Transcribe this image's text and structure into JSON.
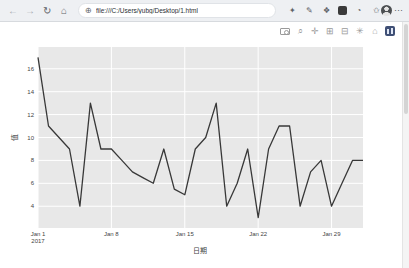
{
  "browser": {
    "nav": {
      "back_icon": "←",
      "forward_icon": "→",
      "refresh_icon": "↻",
      "home_icon": "⌂"
    },
    "address": {
      "site_icon": "⊕",
      "url": "file:///C:/Users/yubg/Desktop/1.html"
    },
    "extensions": [
      {
        "name": "extension-icon-1",
        "glyph": "✦"
      },
      {
        "name": "extension-icon-2",
        "glyph": "✎"
      },
      {
        "name": "extension-icon-3",
        "glyph": "❖"
      },
      {
        "name": "extension-icon-4",
        "glyph": "",
        "dark": true
      },
      {
        "name": "extension-icon-5",
        "glyph": "◔"
      },
      {
        "name": "extension-icon-6",
        "glyph": "✩"
      }
    ],
    "more_icon": "⋯"
  },
  "modebar": {
    "buttons": [
      {
        "name": "download-plot-camera-icon",
        "type": "camera",
        "glyph": ""
      },
      {
        "name": "zoom-icon",
        "glyph": "⌕"
      },
      {
        "name": "pan-icon",
        "glyph": "✛"
      },
      {
        "name": "zoom-in-icon",
        "glyph": "⊞"
      },
      {
        "name": "zoom-out-icon",
        "glyph": "⊟"
      },
      {
        "name": "autoscale-icon",
        "glyph": "✳"
      },
      {
        "name": "reset-axes-icon",
        "glyph": "⌂"
      },
      {
        "name": "plotly-logo-icon",
        "type": "logo",
        "glyph": ""
      }
    ]
  },
  "chart_data": {
    "type": "line",
    "title": "",
    "xlabel": "日期",
    "ylabel": "值",
    "x_year": "2017",
    "x_dates": [
      "Jan 1",
      "Jan 2",
      "Jan 3",
      "Jan 4",
      "Jan 5",
      "Jan 6",
      "Jan 7",
      "Jan 8",
      "Jan 9",
      "Jan 10",
      "Jan 11",
      "Jan 12",
      "Jan 13",
      "Jan 14",
      "Jan 15",
      "Jan 16",
      "Jan 17",
      "Jan 18",
      "Jan 19",
      "Jan 20",
      "Jan 21",
      "Jan 22",
      "Jan 23",
      "Jan 24",
      "Jan 25",
      "Jan 26",
      "Jan 27",
      "Jan 28",
      "Jan 29",
      "Jan 30",
      "Jan 31",
      "Feb 1"
    ],
    "values": [
      17,
      11,
      10,
      9,
      4,
      13,
      9,
      9,
      8,
      7,
      6.5,
      6,
      9,
      5.5,
      5,
      9,
      10,
      13,
      4,
      6,
      9,
      3,
      9,
      11,
      11,
      4,
      7,
      8,
      4,
      6,
      8,
      8
    ],
    "yticks": [
      4,
      6,
      8,
      10,
      12,
      14,
      16
    ],
    "xticks": [
      {
        "label": "Jan 1",
        "sublabel": "2017",
        "index": 0
      },
      {
        "label": "Jan 8",
        "index": 7
      },
      {
        "label": "Jan 15",
        "index": 14
      },
      {
        "label": "Jan 22",
        "index": 21
      },
      {
        "label": "Jan 29",
        "index": 28
      }
    ],
    "ylim": [
      2.1,
      17.9
    ],
    "grid": true,
    "legend": "none",
    "colors": {
      "line": "#383838",
      "plot_bg": "#e8e8e8",
      "grid": "#ffffff",
      "tick_text": "#444444"
    }
  }
}
